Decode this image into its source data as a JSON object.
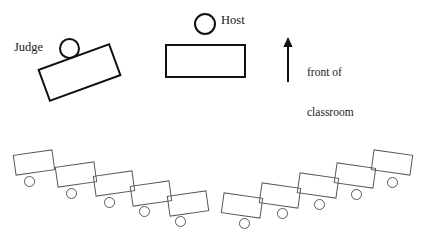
{
  "diagram": {
    "background_color": "#ffffff",
    "stroke_color_primary": "#111111",
    "stroke_color_secondary": "#5a5a5a"
  },
  "labels": {
    "judge": "Judge",
    "host": "Host",
    "front_of_classroom_line1": "front of",
    "front_of_classroom_line2": "classroom"
  },
  "figures": {
    "judge": {
      "name": "Judge",
      "head_shape": "circle",
      "desk_shape": "rectangle",
      "desk_rotation_deg": -20
    },
    "host": {
      "name": "Host",
      "head_shape": "circle",
      "desk_shape": "rectangle",
      "desk_rotation_deg": 0
    }
  },
  "arrow": {
    "direction": "up",
    "meaning": "front of classroom"
  },
  "student_rows": [
    {
      "name": "left-row",
      "count": 5,
      "desks": [
        {
          "x": 14,
          "y": 152,
          "w": 40,
          "h": 21,
          "rot": -8,
          "seat_x": 24,
          "seat_y": 176,
          "seat_d": 11
        },
        {
          "x": 56,
          "y": 164,
          "w": 40,
          "h": 21,
          "rot": -8,
          "seat_x": 66,
          "seat_y": 188,
          "seat_d": 11
        },
        {
          "x": 94,
          "y": 173,
          "w": 40,
          "h": 21,
          "rot": -8,
          "seat_x": 104,
          "seat_y": 197,
          "seat_d": 11
        },
        {
          "x": 131,
          "y": 183,
          "w": 40,
          "h": 21,
          "rot": -8,
          "seat_x": 139,
          "seat_y": 206,
          "seat_d": 11
        },
        {
          "x": 168,
          "y": 193,
          "w": 40,
          "h": 21,
          "rot": -8,
          "seat_x": 175,
          "seat_y": 216,
          "seat_d": 11
        }
      ]
    },
    {
      "name": "right-row",
      "count": 5,
      "desks": [
        {
          "x": 222,
          "y": 195,
          "w": 40,
          "h": 21,
          "rot": 8,
          "seat_x": 239,
          "seat_y": 218,
          "seat_d": 11
        },
        {
          "x": 260,
          "y": 185,
          "w": 40,
          "h": 21,
          "rot": 8,
          "seat_x": 277,
          "seat_y": 208,
          "seat_d": 11
        },
        {
          "x": 298,
          "y": 175,
          "w": 40,
          "h": 21,
          "rot": 8,
          "seat_x": 314,
          "seat_y": 199,
          "seat_d": 11
        },
        {
          "x": 335,
          "y": 165,
          "w": 40,
          "h": 21,
          "rot": 8,
          "seat_x": 351,
          "seat_y": 189,
          "seat_d": 11
        },
        {
          "x": 372,
          "y": 152,
          "w": 40,
          "h": 21,
          "rot": 8,
          "seat_x": 387,
          "seat_y": 177,
          "seat_d": 11
        }
      ]
    }
  ]
}
